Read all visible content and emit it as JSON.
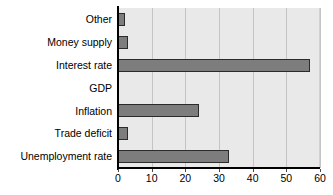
{
  "chart_data": {
    "type": "bar",
    "orientation": "horizontal",
    "title": "",
    "xlabel": "",
    "ylabel": "",
    "categories": [
      "Other",
      "Money supply",
      "Interest rate",
      "GDP",
      "Inflation",
      "Trade deficit",
      "Unemployment rate"
    ],
    "values": [
      2,
      3,
      57,
      0,
      24,
      3,
      33
    ],
    "xlim": [
      0,
      60
    ],
    "xticks": [
      0,
      10,
      20,
      30,
      40,
      50,
      60
    ],
    "xtick_labels": [
      "0",
      "10",
      "20",
      "30",
      "40",
      "50",
      "60"
    ],
    "grid": "vertical",
    "legend": "none",
    "bar_color": "#7d7d7d",
    "bar_edge_color": "#2b2b2b",
    "plot_background": "#e9e9e9",
    "axis_color": "#000000",
    "gridline_color": "#c4c4c4",
    "text_color": "#000000"
  }
}
